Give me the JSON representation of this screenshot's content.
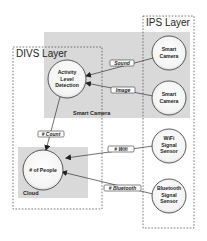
{
  "diagram": {
    "regions": {
      "smart_camera": {
        "label": "Smart Camera",
        "fill": "#d8d8d8"
      },
      "cloud": {
        "label": "Cloud",
        "fill": "#d8d8d8"
      },
      "divs_layer": {
        "label": "DIVS Layer"
      },
      "ips_layer": {
        "label": "IPS Layer"
      }
    },
    "nodes": {
      "activity": {
        "lines": [
          "Activity",
          "Level",
          "Detection"
        ]
      },
      "people": {
        "lines": [
          "# of People"
        ]
      },
      "camera1": {
        "lines": [
          "Smart",
          "Camera"
        ]
      },
      "camera2": {
        "lines": [
          "Smart",
          "Camera"
        ]
      },
      "wifi": {
        "lines": [
          "WiFi",
          "Signal",
          "Sensor"
        ]
      },
      "bluetooth": {
        "lines": [
          "Bluetooth",
          "Signal",
          "Sensor"
        ]
      }
    },
    "edges": {
      "sound": {
        "label": "Sound",
        "from": "Smart Camera",
        "to": "Activity Level Detection"
      },
      "image": {
        "label": "Image",
        "from": "Smart Camera",
        "to": "Activity Level Detection"
      },
      "count": {
        "label": "# Count",
        "from": "Activity Level Detection",
        "to": "# of People"
      },
      "wifi": {
        "label": "# Wifi",
        "from": "WiFi Signal Sensor",
        "to": "Cloud"
      },
      "bluetooth": {
        "label": "# Bluetooth",
        "from": "Bluetooth Signal Sensor",
        "to": "# of People"
      }
    }
  }
}
